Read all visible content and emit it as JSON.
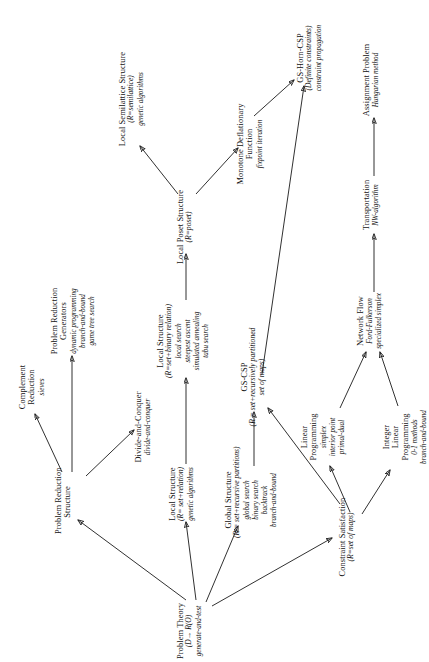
{
  "diagram": {
    "type": "hierarchy-tree",
    "orientation": "rotated-90-ccw",
    "stroke_color": "#1a1a1a",
    "background_color": "#ffffff",
    "nodes": [
      {
        "id": "problem-theory",
        "title": "Problem Theory",
        "sub": "(D→ R(O)",
        "algs": "generate-and-test"
      },
      {
        "id": "problem-reduction-structure",
        "title": "Problem Reduction\nStructure",
        "title_l1": "Problem Reduction",
        "title_l2": "Structure",
        "sub": "",
        "algs": ""
      },
      {
        "id": "complement-reduction",
        "title_l1": "Complement",
        "title_l2": "Reduction",
        "sub": "",
        "algs": "sieves"
      },
      {
        "id": "problem-reduction-generators",
        "title_l1": "Problem Reduction",
        "title_l2": "Generators",
        "sub": "",
        "algs": "dynamic programming\nbranch-and-bound\ngame tree search",
        "algs_lines": [
          "dynamic programming",
          "branch-and-bound",
          "game tree search"
        ]
      },
      {
        "id": "divide-and-conquer",
        "title_l1": "Divide-and-Conquer",
        "sub": "",
        "algs": "divide-and-conquer"
      },
      {
        "id": "local-structure-relation",
        "title_l1": "Local Structure",
        "sub": "(R= set+relation)",
        "algs_lines": [
          "genetic algorithms"
        ]
      },
      {
        "id": "local-structure-binary-relation",
        "title_l1": "Local Structure",
        "sub": "(R=set+binary relation)",
        "algs_lines": [
          "local search",
          "steepest ascent",
          "simulated annealing",
          "tabu search"
        ]
      },
      {
        "id": "local-poset-structure",
        "title_l1": "Local Poset Structure",
        "sub": "(R=poset)",
        "algs_lines": []
      },
      {
        "id": "local-semilattice-structure",
        "title_l1": "Local Semilattice Structure",
        "sub": "(R=semilattice)",
        "algs_lines": [
          "genetic algorithms"
        ]
      },
      {
        "id": "monotone-deflationary-function",
        "title_l1": "Monotone Deflationary",
        "title_l2": "Function",
        "sub": "",
        "algs_lines": [
          "fixpoint iteration"
        ]
      },
      {
        "id": "global-structure",
        "title_l1": "Global Structure",
        "sub": "(R = set+recursive partitions)",
        "algs_lines": [
          "global search",
          "binary search",
          "backtrack",
          "branch-and-bound"
        ]
      },
      {
        "id": "gs-csp",
        "title_l1": "GS-CSP",
        "sub": "(R = set+recursively partitioned",
        "sub2": "set of maps)",
        "algs_lines": []
      },
      {
        "id": "gs-horn-csp",
        "title_l1": "GS-Horn-CSP",
        "sub": "(Definite constraints)",
        "algs_lines": [
          "constraint propagation"
        ]
      },
      {
        "id": "constraint-satisfaction",
        "title_l1": "Constraint Satisfaction",
        "sub": "(R=set of maps)",
        "algs_lines": []
      },
      {
        "id": "linear-programming",
        "title_l1": "Linear",
        "title_l2": "Programming",
        "sub": "",
        "algs_lines": [
          "simplex",
          "interior point",
          "primal-dual"
        ]
      },
      {
        "id": "integer-linear-programming",
        "title_l1": "Integer",
        "title_l2": "Linear",
        "title_l3": "Programming",
        "sub": "",
        "algs_lines": [
          "0-1 methods",
          "branch-and-bound"
        ]
      },
      {
        "id": "network-flow",
        "title_l1": "Network Flow",
        "sub": "",
        "algs_lines": [
          "Ford-Fulkerson",
          "specialized simplex"
        ]
      },
      {
        "id": "transportation",
        "title_l1": "Transportation",
        "sub": "",
        "algs_lines": [
          "NW-algorithm"
        ]
      },
      {
        "id": "assignment-problem",
        "title_l1": "Assignment Problem",
        "sub": "",
        "algs_lines": [
          "Hungarian method"
        ]
      }
    ],
    "edges": [
      {
        "from": "problem-theory",
        "to": "problem-reduction-structure"
      },
      {
        "from": "problem-theory",
        "to": "local-structure-relation"
      },
      {
        "from": "problem-theory",
        "to": "global-structure"
      },
      {
        "from": "problem-theory",
        "to": "constraint-satisfaction"
      },
      {
        "from": "problem-reduction-structure",
        "to": "complement-reduction"
      },
      {
        "from": "problem-reduction-structure",
        "to": "problem-reduction-generators"
      },
      {
        "from": "problem-reduction-structure",
        "to": "divide-and-conquer"
      },
      {
        "from": "local-structure-relation",
        "to": "local-structure-binary-relation"
      },
      {
        "from": "local-structure-binary-relation",
        "to": "local-poset-structure"
      },
      {
        "from": "local-poset-structure",
        "to": "local-semilattice-structure"
      },
      {
        "from": "local-poset-structure",
        "to": "monotone-deflationary-function"
      },
      {
        "from": "monotone-deflationary-function",
        "to": "gs-horn-csp"
      },
      {
        "from": "global-structure",
        "to": "gs-csp"
      },
      {
        "from": "gs-csp",
        "to": "gs-horn-csp"
      },
      {
        "from": "constraint-satisfaction",
        "to": "gs-csp"
      },
      {
        "from": "constraint-satisfaction",
        "to": "linear-programming"
      },
      {
        "from": "constraint-satisfaction",
        "to": "integer-linear-programming"
      },
      {
        "from": "linear-programming",
        "to": "network-flow"
      },
      {
        "from": "integer-linear-programming",
        "to": "network-flow"
      },
      {
        "from": "network-flow",
        "to": "transportation"
      },
      {
        "from": "transportation",
        "to": "assignment-problem"
      }
    ]
  }
}
